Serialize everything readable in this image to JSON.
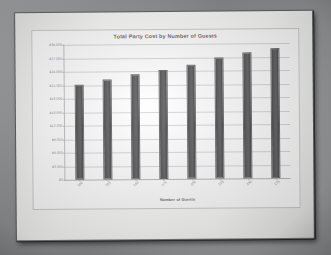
{
  "chart_data": {
    "type": "bar",
    "title": "Total Party Cost by Number of Guests",
    "xlabel": "Number of Guests",
    "ylabel": "",
    "categories": [
      "100",
      "125",
      "150",
      "175",
      "200",
      "225",
      "250",
      "275"
    ],
    "values": [
      21200,
      22300,
      23300,
      24300,
      25400,
      26800,
      28000,
      29000
    ],
    "ylim": [
      0,
      30000
    ],
    "ytick_labels": [
      "$30,000",
      "$27,000",
      "$24,000",
      "$21,000",
      "$18,000",
      "$15,000",
      "$12,000",
      "$9,000",
      "$6,000",
      "$3,000",
      "$0"
    ],
    "ytick_values": [
      30000,
      27000,
      24000,
      21000,
      18000,
      15000,
      12000,
      9000,
      6000,
      3000,
      0
    ],
    "grid": true,
    "legend": false,
    "series": [
      {
        "name": "Total Party Cost",
        "color": "#5a5a5c",
        "values": [
          21200,
          22300,
          23300,
          24300,
          25400,
          26800,
          28000,
          29000
        ]
      }
    ]
  },
  "photo": {
    "subject": "printed-bar-chart-on-paper",
    "paper_color": "#fdfdfc",
    "background_color": "#98999b"
  }
}
